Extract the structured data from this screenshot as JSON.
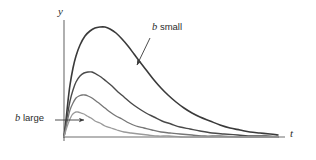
{
  "figure": {
    "title": "",
    "axes": {
      "y_label": "y",
      "t_label": "t",
      "origin": [
        64,
        137
      ],
      "y_axis_top": 20,
      "t_axis_right": 285
    },
    "annotations": [
      {
        "name": "b-small",
        "var": "b",
        "text": " small",
        "full_text": "b small",
        "label_pos": [
          152,
          22
        ],
        "arrow_from": [
          150,
          38
        ],
        "arrow_to": [
          136,
          66
        ]
      },
      {
        "name": "b-large",
        "var": "b",
        "text": " large",
        "full_text": "b large",
        "label_pos": [
          15,
          113
        ],
        "arrow_from": [
          55,
          120
        ],
        "arrow_to": [
          85,
          120
        ]
      }
    ],
    "colors": {
      "axis": "#6e6e6e",
      "curve_darkest": "#3a3a3a",
      "curve_dark": "#4a4a4a",
      "curve_mid": "#767676",
      "curve_light": "#9a9a9a",
      "background": "#ffffff",
      "text": "#2b2b2b"
    }
  },
  "chart_data": {
    "type": "line",
    "title": "",
    "xlabel": "t",
    "ylabel": "y",
    "grid": false,
    "legend": "none",
    "xlim": [
      0,
      1
    ],
    "ylim": [
      0,
      1
    ],
    "series": [
      {
        "name": "b smallest",
        "b_label": "b small",
        "color": "#3a3a3a",
        "width": 1.6,
        "peak_px": [
          103,
          27
        ],
        "peak_xy": [
          0.176,
          0.967
        ],
        "points_px": [
          [
            64,
            137
          ],
          [
            66,
            120
          ],
          [
            68,
            101
          ],
          [
            70,
            85
          ],
          [
            73,
            68
          ],
          [
            76,
            56
          ],
          [
            80,
            45
          ],
          [
            85,
            36
          ],
          [
            90,
            31
          ],
          [
            95,
            28
          ],
          [
            100,
            27
          ],
          [
            105,
            27
          ],
          [
            110,
            29
          ],
          [
            116,
            33
          ],
          [
            122,
            39
          ],
          [
            128,
            46
          ],
          [
            134,
            54
          ],
          [
            140,
            62
          ],
          [
            147,
            71
          ],
          [
            154,
            80
          ],
          [
            161,
            88
          ],
          [
            168,
            95
          ],
          [
            176,
            102
          ],
          [
            184,
            108
          ],
          [
            192,
            113
          ],
          [
            200,
            117
          ],
          [
            210,
            121
          ],
          [
            220,
            125
          ],
          [
            230,
            128
          ],
          [
            240,
            130
          ],
          [
            250,
            132
          ],
          [
            260,
            133
          ],
          [
            270,
            134
          ],
          [
            278,
            135
          ]
        ]
      },
      {
        "name": "b small-mid",
        "color": "#4a4a4a",
        "width": 1.4,
        "peak_px": [
          88,
          72
        ],
        "peak_xy": [
          0.108,
          0.583
        ],
        "points_px": [
          [
            64,
            137
          ],
          [
            66,
            124
          ],
          [
            68,
            112
          ],
          [
            70,
            101
          ],
          [
            73,
            90
          ],
          [
            76,
            82
          ],
          [
            80,
            76
          ],
          [
            84,
            73
          ],
          [
            88,
            72
          ],
          [
            92,
            72
          ],
          [
            96,
            74
          ],
          [
            101,
            77
          ],
          [
            106,
            81
          ],
          [
            112,
            86
          ],
          [
            118,
            92
          ],
          [
            124,
            97
          ],
          [
            131,
            103
          ],
          [
            138,
            108
          ],
          [
            146,
            113
          ],
          [
            154,
            117
          ],
          [
            162,
            121
          ],
          [
            171,
            124
          ],
          [
            180,
            127
          ],
          [
            190,
            129
          ],
          [
            200,
            131
          ],
          [
            212,
            133
          ],
          [
            224,
            134
          ],
          [
            238,
            135
          ],
          [
            252,
            136
          ],
          [
            266,
            136
          ],
          [
            278,
            137
          ]
        ]
      },
      {
        "name": "b mid-large",
        "color": "#767676",
        "width": 1.3,
        "peak_px": [
          80,
          95
        ],
        "peak_xy": [
          0.072,
          0.36
        ],
        "points_px": [
          [
            64,
            137
          ],
          [
            66,
            127
          ],
          [
            68,
            118
          ],
          [
            70,
            110
          ],
          [
            73,
            103
          ],
          [
            76,
            98
          ],
          [
            79,
            96
          ],
          [
            82,
            95
          ],
          [
            85,
            95
          ],
          [
            88,
            96
          ],
          [
            92,
            98
          ],
          [
            96,
            101
          ],
          [
            100,
            104
          ],
          [
            105,
            108
          ],
          [
            110,
            112
          ],
          [
            116,
            116
          ],
          [
            122,
            119
          ],
          [
            129,
            123
          ],
          [
            136,
            126
          ],
          [
            144,
            128
          ],
          [
            152,
            130
          ],
          [
            161,
            132
          ],
          [
            170,
            133
          ],
          [
            180,
            134
          ],
          [
            192,
            135
          ],
          [
            205,
            136
          ],
          [
            220,
            136
          ],
          [
            236,
            137
          ],
          [
            252,
            137
          ],
          [
            270,
            137
          ],
          [
            278,
            137
          ]
        ]
      },
      {
        "name": "b largest",
        "b_label": "b large",
        "color": "#9a9a9a",
        "width": 1.3,
        "peak_px": [
          75,
          112
        ],
        "peak_xy": [
          0.05,
          0.195
        ],
        "points_px": [
          [
            64,
            137
          ],
          [
            66,
            130
          ],
          [
            68,
            124
          ],
          [
            70,
            119
          ],
          [
            72,
            115
          ],
          [
            74,
            113
          ],
          [
            76,
            112
          ],
          [
            78,
            112
          ],
          [
            81,
            113
          ],
          [
            84,
            114
          ],
          [
            87,
            116
          ],
          [
            91,
            118
          ],
          [
            95,
            121
          ],
          [
            100,
            123
          ],
          [
            105,
            126
          ],
          [
            111,
            128
          ],
          [
            117,
            130
          ],
          [
            124,
            132
          ],
          [
            131,
            133
          ],
          [
            139,
            134
          ],
          [
            148,
            135
          ],
          [
            158,
            136
          ],
          [
            169,
            136
          ],
          [
            181,
            137
          ],
          [
            195,
            137
          ],
          [
            210,
            137
          ],
          [
            228,
            137
          ],
          [
            248,
            137
          ],
          [
            268,
            137
          ],
          [
            278,
            137
          ]
        ]
      }
    ]
  }
}
